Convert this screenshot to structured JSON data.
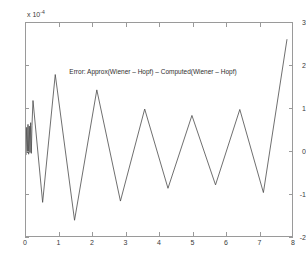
{
  "figure": {
    "background_color": "#ffffff",
    "axis_color": "#9a9a9a",
    "line_color": "#4a4a4a"
  },
  "annotation": {
    "text": "Error:  Approx(Wiener – Hopf)  –  Computed(Wiener – Hopf)"
  },
  "axis": {
    "exponent_prefix": "x 10",
    "exponent_power": "-4",
    "y_ticks": [
      "3",
      "2",
      "1",
      "0",
      "-1",
      "-2"
    ],
    "x_ticks": [
      "0",
      "1",
      "2",
      "3",
      "4",
      "5",
      "6",
      "7",
      "8"
    ]
  },
  "chart_data": {
    "type": "line",
    "title": "Error:  Approx(Wiener – Hopf)  –  Computed(Wiener – Hopf)",
    "xlabel": "",
    "ylabel": "",
    "y_scale_exponent": -4,
    "xlim": [
      0,
      8
    ],
    "ylim": [
      -2,
      3
    ],
    "grid": false,
    "legend": null,
    "series": [
      {
        "name": "error",
        "x": [
          0.0,
          0.02,
          0.04,
          0.06,
          0.08,
          0.1,
          0.12,
          0.14,
          0.16,
          0.18,
          0.21,
          0.5,
          0.88,
          1.46,
          2.13,
          2.84,
          3.57,
          4.27,
          4.99,
          5.7,
          6.43,
          7.14,
          7.85
        ],
        "y": [
          -0.1,
          0.55,
          -0.05,
          0.62,
          -0.08,
          0.58,
          -0.04,
          0.66,
          -0.06,
          0.6,
          1.18,
          -1.21,
          1.79,
          -1.63,
          1.43,
          -1.18,
          0.98,
          -0.88,
          0.83,
          -0.8,
          0.97,
          -0.98,
          2.62
        ]
      }
    ]
  }
}
